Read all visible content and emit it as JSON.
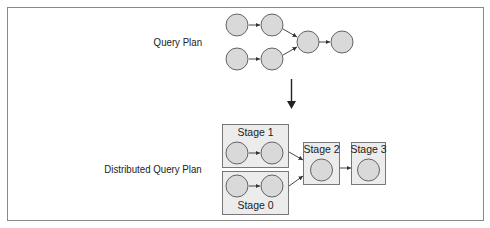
{
  "diagram": {
    "labels": {
      "query_plan": "Query Plan",
      "distributed_query_plan": "Distributed Query Plan"
    },
    "stages": [
      {
        "id": "stage1",
        "label": "Stage 1"
      },
      {
        "id": "stage0",
        "label": "Stage 0"
      },
      {
        "id": "stage2",
        "label": "Stage 2"
      },
      {
        "id": "stage3",
        "label": "Stage 3"
      }
    ],
    "colors": {
      "node_fill": "#d9d9d9",
      "node_stroke": "#555555",
      "stage_fill": "#ececec",
      "stage_stroke": "#6a6a6a",
      "arrow": "#333333"
    }
  }
}
